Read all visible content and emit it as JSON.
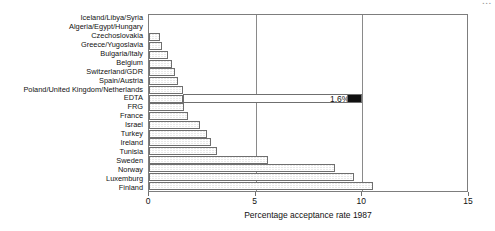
{
  "corner_artifact": "...",
  "chart_data": {
    "type": "bar",
    "orientation": "horizontal",
    "title": "",
    "xlabel": "Percentage acceptance rate 1987",
    "ylabel": "",
    "xlim": [
      0,
      15
    ],
    "xticks": [
      0,
      5,
      10,
      15
    ],
    "xticklabels": [
      "0",
      "5",
      "10",
      "15"
    ],
    "grid": true,
    "gridlines_at": [
      5,
      10
    ],
    "legend": "none",
    "categories": [
      "Iceland/Libya/Syria",
      "Algeria/Egypt/Hungary",
      "Czechoslovakia",
      "Greece/Yugoslavia",
      "Bulgaria/Italy",
      "Belgium",
      "Switzerland/GDR",
      "Spain/Austria",
      "Poland/United Kingdom/Netherlands",
      "EDTA",
      "FRG",
      "France",
      "Israel",
      "Turkey",
      "Ireland",
      "Tunisia",
      "Sweden",
      "Norway",
      "Luxemburg",
      "Finland"
    ],
    "values": [
      0,
      0,
      0.5,
      0.6,
      0.9,
      1.1,
      1.2,
      1.35,
      1.6,
      1.6,
      1.65,
      1.85,
      2.4,
      2.7,
      2.9,
      3.2,
      5.6,
      8.7,
      9.6,
      10.5
    ],
    "annotations": [
      {
        "category": "EDTA",
        "label": "1.6%",
        "marker_value": 10.0,
        "marker_color": "#101010",
        "type": "callout-box"
      }
    ]
  },
  "style": {
    "bar_fill": "#d2d2d2",
    "bar_edge": "#6f6f6f",
    "axis_color": "#7d7d7d",
    "text_color": "#111111"
  }
}
